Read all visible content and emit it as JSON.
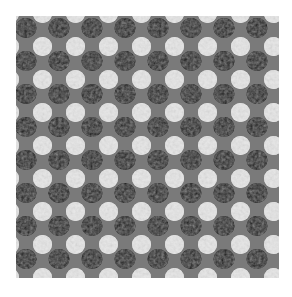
{
  "image": {
    "subject": "knitted fabric swatch with staggered black and white dot pattern on gray",
    "colors": {
      "background": "#ffffff",
      "fabric_gray": "#7a7a7a",
      "dot_black": "#111111",
      "dot_white": "#e6e6e6"
    },
    "pattern": {
      "period_x": 33,
      "period_y": 33,
      "columns": 8,
      "rows": 8
    }
  }
}
